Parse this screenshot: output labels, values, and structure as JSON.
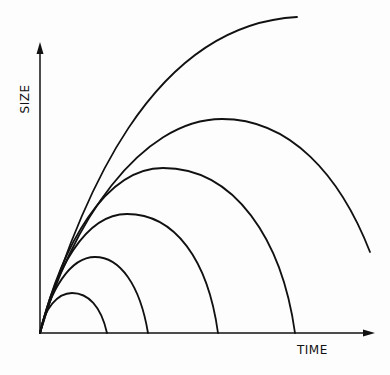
{
  "diagram": {
    "type": "growth curves",
    "axes": {
      "x_label": "TIME",
      "y_label": "SIZE",
      "origin": [
        40,
        333
      ],
      "x_arrow_end": [
        374,
        333
      ],
      "y_arrow_end": [
        40,
        43
      ]
    },
    "stroke_color": "#111111",
    "background_color": "#fdfdfd",
    "curves": [
      {
        "name": "curve-1",
        "peak": [
          72,
          293
        ],
        "end": [
          107,
          333
        ],
        "path": "M40,333 C44,308 58,293 72,293 C88,293 101,306 107,333"
      },
      {
        "name": "curve-2",
        "peak": [
          95,
          257
        ],
        "end": [
          148,
          333
        ],
        "path": "M40,333 C50,290 70,257 95,257 C120,257 140,285 148,333"
      },
      {
        "name": "curve-3",
        "peak": [
          127,
          214
        ],
        "end": [
          218,
          333
        ],
        "path": "M40,333 C55,270 85,214 127,214 C175,214 208,260 218,333"
      },
      {
        "name": "curve-4",
        "peak": [
          163,
          168
        ],
        "end": [
          295,
          333
        ],
        "path": "M40,333 C62,245 105,168 163,168 C235,168 282,240 295,333"
      },
      {
        "name": "curve-5",
        "peak": [
          222,
          119
        ],
        "end": [
          370,
          252
        ],
        "path": "M40,333 C70,225 140,119 222,119 C290,119 340,175 370,252"
      },
      {
        "name": "curve-6",
        "peak": [
          297,
          17
        ],
        "end": [
          297,
          17
        ],
        "path": "M40,333 C80,200 150,25 297,17"
      }
    ]
  }
}
